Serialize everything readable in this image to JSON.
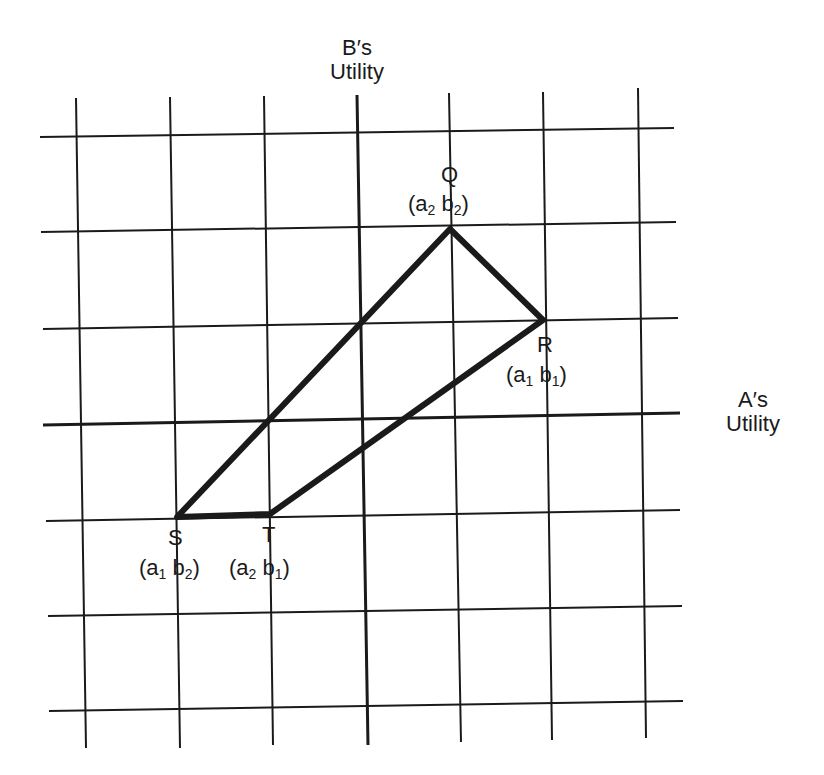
{
  "axes": {
    "y_label_line1": "B′s",
    "y_label_line2": "Utility",
    "x_label_line1": "A′s",
    "x_label_line2": "Utility"
  },
  "points": {
    "Q": {
      "letter": "Q",
      "a": "a",
      "a_sub": "2",
      "b": "b",
      "b_sub": "2"
    },
    "R": {
      "letter": "R",
      "a": "a",
      "a_sub": "1",
      "b": "b",
      "b_sub": "1"
    },
    "S": {
      "letter": "S",
      "a": "a",
      "a_sub": "1",
      "b": "b",
      "b_sub": "2"
    },
    "T": {
      "letter": "T",
      "a": "a",
      "a_sub": "2",
      "b": "b",
      "b_sub": "1"
    }
  },
  "colors": {
    "ink": "#1a1a1a",
    "background": "#ffffff"
  }
}
